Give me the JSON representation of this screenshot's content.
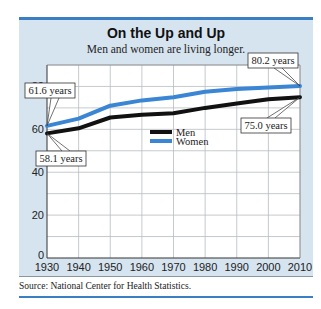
{
  "header": {
    "top_text": "...ownership interest of a second ... p..."
  },
  "chart_data": {
    "type": "line",
    "title": "On the Up and Up",
    "subtitle": "Men and women are living longer.",
    "xlabel": "",
    "ylabel": "",
    "x": [
      1930,
      1940,
      1950,
      1960,
      1970,
      1980,
      1990,
      2000,
      2010
    ],
    "series": [
      {
        "name": "Men",
        "color": "#111111",
        "values": [
          58.1,
          60.5,
          65.5,
          66.8,
          67.5,
          70.0,
          72.0,
          74.0,
          75.0
        ]
      },
      {
        "name": "Women",
        "color": "#3a86d4",
        "values": [
          61.6,
          65.0,
          71.0,
          73.5,
          75.0,
          77.5,
          78.8,
          79.5,
          80.2
        ]
      }
    ],
    "ylim": [
      0,
      90
    ],
    "yticks": [
      0,
      20,
      40,
      60,
      80
    ],
    "xticks": [
      1930,
      1940,
      1950,
      1960,
      1970,
      1980,
      1990,
      2000,
      2010
    ],
    "grid": true,
    "legend_position": "center-right",
    "annotations": [
      {
        "text": "61.6 years",
        "x": 1930,
        "y": 61.6,
        "series": "Women"
      },
      {
        "text": "58.1 years",
        "x": 1930,
        "y": 58.1,
        "series": "Men"
      },
      {
        "text": "80.2 years",
        "x": 2010,
        "y": 80.2,
        "series": "Women"
      },
      {
        "text": "75.0 years",
        "x": 2010,
        "y": 75.0,
        "series": "Men"
      }
    ],
    "source": "Source: National Center for Health Statistics."
  },
  "colors": {
    "accent": "#3a7fc4",
    "panel_bg": "#d6e4f0",
    "plot_bg": "#ffffff"
  }
}
